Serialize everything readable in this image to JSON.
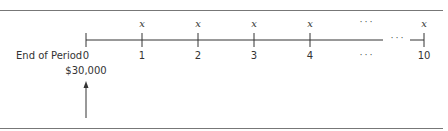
{
  "diagram": {
    "row_label": "End of Period",
    "periods": [
      "0",
      "1",
      "2",
      "3",
      "4",
      "...",
      "10"
    ],
    "payment_labels": [
      "",
      "x",
      "x",
      "x",
      "x",
      "...",
      "x"
    ],
    "present_value": "$30,000",
    "ellipsis": "· · ·"
  }
}
